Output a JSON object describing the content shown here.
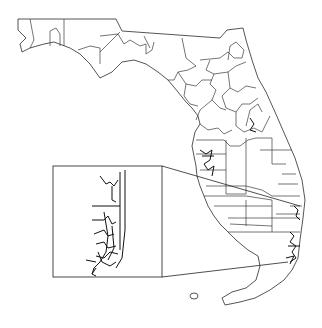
{
  "map": {
    "title": "Florida district boundaries",
    "region": "Florida",
    "inset": {
      "label": "Southeast Florida detail (Palm Beach–Broward–Miami-Dade)",
      "box": {
        "x": 53,
        "y": 166,
        "w": 109,
        "h": 111
      }
    },
    "colors": {
      "line": "#333333",
      "background": "#ffffff"
    }
  },
  "caption": ""
}
